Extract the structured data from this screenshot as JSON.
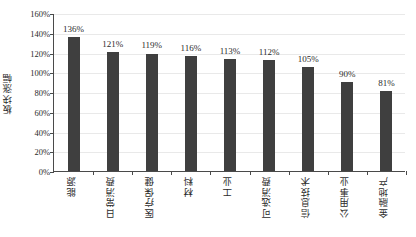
{
  "chart_data": {
    "type": "bar",
    "title": "",
    "subtitle": "",
    "xlabel": "",
    "ylabel": "板块涨幅",
    "categories": [
      "能源",
      "日常消费",
      "医疗保健",
      "材料",
      "工业",
      "可选消费",
      "信息技术",
      "公用事业",
      "金融地产"
    ],
    "values": [
      136,
      121,
      119,
      116,
      113,
      112,
      105,
      90,
      81
    ],
    "data_labels": [
      "136%",
      "121%",
      "119%",
      "116%",
      "113%",
      "112%",
      "105%",
      "90%",
      "81%"
    ],
    "ylim": [
      0,
      160
    ],
    "ytick_values": [
      0,
      20,
      40,
      60,
      80,
      100,
      120,
      140,
      160
    ],
    "ytick_labels": [
      "0%",
      "20%",
      "40%",
      "60%",
      "80%",
      "100%",
      "120%",
      "140%",
      "160%"
    ],
    "grid": true,
    "grid_axis": "y",
    "legend": false,
    "legend_position": "none",
    "bar_color": "#3f3f3f",
    "axis_color": "#4a4a4a",
    "gridline_color": "#e9e9e9",
    "background_color": "#ffffff",
    "xtick_label_rotation": 90
  }
}
